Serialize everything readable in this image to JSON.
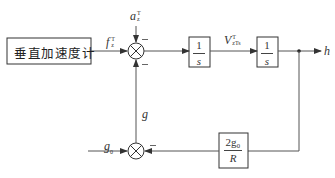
{
  "diagram": {
    "type": "block_diagram",
    "colors": {
      "line": "#555555",
      "text": "#333333",
      "background": "#ffffff"
    },
    "blocks": {
      "accelerometer": {
        "label": "垂直加速度计"
      },
      "integrator1": {
        "numerator": "1",
        "denominator": "s"
      },
      "integrator2": {
        "numerator": "1",
        "denominator": "s"
      },
      "feedback": {
        "numerator": "2g₀",
        "denominator": "R"
      }
    },
    "signals": {
      "a_z": {
        "base": "a",
        "sup": "T",
        "sub": "z"
      },
      "f_z": {
        "base": "f",
        "sup": "T",
        "sub": "z"
      },
      "v_z": {
        "base": "V",
        "sup": "T",
        "sub": "zTs"
      },
      "h": {
        "base": "h"
      },
      "g": {
        "base": "g"
      },
      "g0": {
        "base": "g",
        "sub": "0"
      }
    },
    "summing_junctions": [
      {
        "id": "top",
        "inputs": [
          "f_z (+)",
          "a_z (−)",
          "g (−)"
        ],
        "output": "to integrator1"
      },
      {
        "id": "bottom",
        "inputs": [
          "g0 (+)",
          "feedback 2g0/R·h (−)"
        ],
        "output": "g"
      }
    ],
    "signs": {
      "minus": "−"
    }
  }
}
